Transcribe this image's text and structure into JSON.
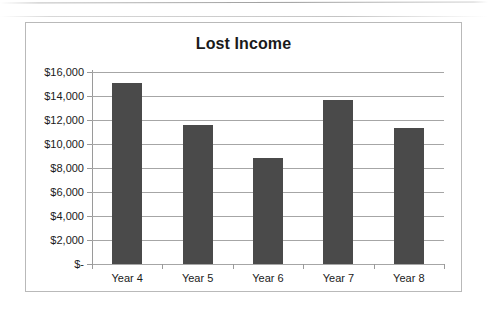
{
  "chart_data": {
    "type": "bar",
    "title": "Lost Income",
    "xlabel": "",
    "ylabel": "",
    "categories": [
      "Year 4",
      "Year 5",
      "Year 6",
      "Year 7",
      "Year 8"
    ],
    "values": [
      15100,
      11600,
      8800,
      13700,
      11300
    ],
    "series": [
      {
        "name": "Lost Income",
        "values": [
          15100,
          11600,
          8800,
          13700,
          11300
        ]
      }
    ],
    "ylim": [
      0,
      16000
    ],
    "ytick_values": [
      0,
      2000,
      4000,
      6000,
      8000,
      10000,
      12000,
      14000,
      16000
    ],
    "ytick_labels": [
      "$-",
      "$2,000",
      "$4,000",
      "$6,000",
      "$8,000",
      "$10,000",
      "$12,000",
      "$14,000",
      "$16,000"
    ],
    "grid": true,
    "legend": false,
    "legend_position": "none",
    "bar_color": "#4a4a4a",
    "gridline_color": "#a6a6a6",
    "axis_color": "#9a9a9a",
    "border_color": "#b9b9b9",
    "text_color": "#1a1a1a"
  }
}
